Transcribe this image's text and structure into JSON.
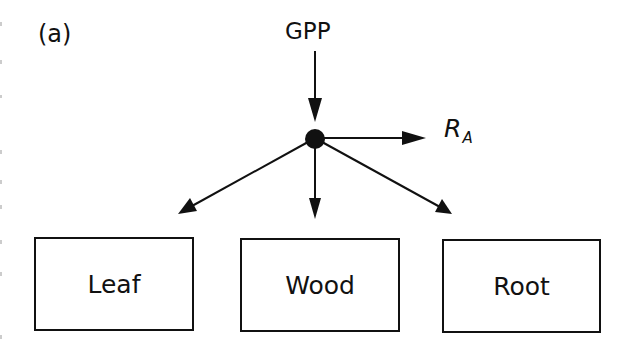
{
  "diagram": {
    "panel_label": "(a)",
    "input": {
      "label": "GPP"
    },
    "output": {
      "label_main": "R",
      "label_sub": "A"
    },
    "junction": {
      "shape": "filled-circle"
    },
    "pools": [
      {
        "label": "Leaf"
      },
      {
        "label": "Wood"
      },
      {
        "label": "Root"
      }
    ],
    "edges": [
      {
        "from": "GPP",
        "to": "junction"
      },
      {
        "from": "junction",
        "to": "R_A"
      },
      {
        "from": "junction",
        "to": "Leaf"
      },
      {
        "from": "junction",
        "to": "Wood"
      },
      {
        "from": "junction",
        "to": "Root"
      }
    ],
    "colors": {
      "stroke": "#111111",
      "background": "#ffffff"
    }
  }
}
